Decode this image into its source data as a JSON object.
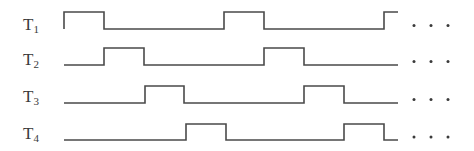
{
  "diagram": {
    "type": "timing-diagram",
    "signals": [
      {
        "name": "T",
        "subscript": "1",
        "pulses": [
          [
            64,
            104
          ],
          [
            224,
            264
          ],
          [
            384,
            398
          ]
        ],
        "start_high": true,
        "x_start": 64,
        "x_end": 398,
        "y_high": 12,
        "y_low": 29,
        "label_top": 16
      },
      {
        "name": "T",
        "subscript": "2",
        "pulses": [
          [
            104,
            144
          ],
          [
            264,
            304
          ]
        ],
        "start_high": false,
        "x_start": 64,
        "x_end": 398,
        "y_high": 48,
        "y_low": 65,
        "label_top": 51
      },
      {
        "name": "T",
        "subscript": "3",
        "pulses": [
          [
            145,
            184
          ],
          [
            304,
            344
          ]
        ],
        "start_high": false,
        "x_start": 64,
        "x_end": 398,
        "y_high": 86,
        "y_low": 103,
        "label_top": 88
      },
      {
        "name": "T",
        "subscript": "4",
        "pulses": [
          [
            186,
            226
          ],
          [
            344,
            384
          ]
        ],
        "start_high": false,
        "x_start": 64,
        "x_end": 398,
        "y_high": 124,
        "y_low": 140,
        "label_top": 125
      }
    ],
    "continuation": "· · ·",
    "ellipsis_dots_x": [
      414,
      431,
      448
    ],
    "colors": {
      "line": "#4a4a4a",
      "text": "#3a3a3a"
    }
  }
}
